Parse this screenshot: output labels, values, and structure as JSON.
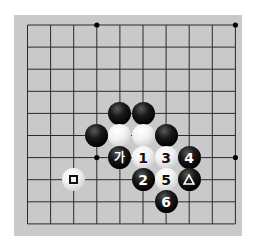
{
  "board": {
    "background": "#c9c9c9",
    "line_color": "#2b2b2b",
    "cols": 10,
    "rows": 10,
    "origin_x": 27.5,
    "origin_y": 25,
    "spacing_x": 23.1,
    "spacing_y": 22.1,
    "star_points": [
      [
        3,
        0
      ],
      [
        9,
        0
      ],
      [
        3,
        6
      ],
      [
        9,
        6
      ]
    ]
  },
  "stones": [
    {
      "color": "black",
      "col": 4,
      "row": 4,
      "label": ""
    },
    {
      "color": "black",
      "col": 5,
      "row": 4,
      "label": ""
    },
    {
      "color": "black",
      "col": 3,
      "row": 5,
      "label": ""
    },
    {
      "color": "white",
      "col": 4,
      "row": 5,
      "label": ""
    },
    {
      "color": "white",
      "col": 5,
      "row": 5,
      "label": ""
    },
    {
      "color": "black",
      "col": 6,
      "row": 5,
      "label": ""
    },
    {
      "color": "black",
      "col": 4,
      "row": 6,
      "label": "가",
      "mark": "korean"
    },
    {
      "color": "white",
      "col": 5,
      "row": 6,
      "label": "1"
    },
    {
      "color": "white",
      "col": 6,
      "row": 6,
      "label": "3"
    },
    {
      "color": "black",
      "col": 7,
      "row": 6,
      "label": "4"
    },
    {
      "color": "white",
      "col": 2,
      "row": 7,
      "label": "",
      "mark": "square"
    },
    {
      "color": "black",
      "col": 5,
      "row": 7,
      "label": "2"
    },
    {
      "color": "white",
      "col": 6,
      "row": 7,
      "label": "5"
    },
    {
      "color": "black",
      "col": 7,
      "row": 7,
      "label": "",
      "mark": "triangle"
    },
    {
      "color": "black",
      "col": 6,
      "row": 8,
      "label": "6"
    }
  ]
}
